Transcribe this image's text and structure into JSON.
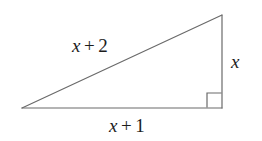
{
  "figure": {
    "type": "right-triangle-diagram",
    "background_color": "#ffffff",
    "stroke_color": "#6a6a6a",
    "text_color": "#1c1c1c",
    "stroke_width": 1.2
  },
  "geometry": {
    "vertices": {
      "left": {
        "x": 22,
        "y": 108
      },
      "top_right": {
        "x": 222,
        "y": 15
      },
      "bottom_right": {
        "x": 222,
        "y": 108
      }
    },
    "right_angle_marker": {
      "at_vertex": "bottom_right",
      "size": 14,
      "x": 207,
      "y": 93
    }
  },
  "labels": {
    "hypotenuse": {
      "variable": "x",
      "operator": "+",
      "constant": "2",
      "full": "x + 2"
    },
    "base": {
      "variable": "x",
      "operator": "+",
      "constant": "1",
      "full": "x + 1"
    },
    "vertical": {
      "variable": "x",
      "full": "x"
    }
  }
}
